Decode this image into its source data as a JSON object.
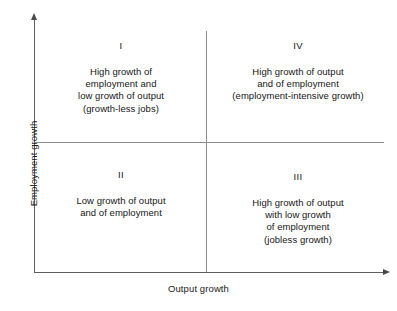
{
  "figure": {
    "title": "",
    "axes": {
      "y_label": "Employment growth",
      "x_label": "Output growth"
    },
    "colors": {
      "axis": "#5d5d5d",
      "divider": "#8b8b8b",
      "text": "#161616",
      "background": "#ffffff"
    }
  },
  "chart_data": {
    "type": "diagram",
    "subtype": "2x2-quadrant-matrix",
    "title": "",
    "xlabel": "Output growth",
    "ylabel": "Employment growth",
    "grid": false,
    "legend": null,
    "axis_arrows": {
      "x": "right",
      "y": "up"
    },
    "quadrants": [
      {
        "numeral": "I",
        "position": "top-left",
        "x": "low output growth",
        "y": "high employment growth",
        "lines": [
          "High growth of",
          "employment and",
          "low growth of output",
          "(growth-less jobs)"
        ]
      },
      {
        "numeral": "IV",
        "position": "top-right",
        "x": "high output growth",
        "y": "high employment growth",
        "lines": [
          "High growth of output",
          "and of employment",
          "(employment-intensive growth)"
        ]
      },
      {
        "numeral": "II",
        "position": "bottom-left",
        "x": "low output growth",
        "y": "low employment growth",
        "lines": [
          "Low growth of output",
          "and of employment"
        ]
      },
      {
        "numeral": "III",
        "position": "bottom-right",
        "x": "high output growth",
        "y": "low employment growth",
        "lines": [
          "High growth of output",
          "with low growth",
          "of employment",
          "(jobless growth)"
        ]
      }
    ]
  }
}
